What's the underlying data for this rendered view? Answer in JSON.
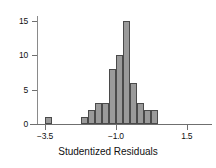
{
  "chart_data": {
    "type": "bar",
    "title": "",
    "subtitle": "",
    "xlabel": "Studentized Residuals",
    "ylabel": "",
    "xlim": [
      -3.75,
      2.25
    ],
    "ylim": [
      0,
      16
    ],
    "grid": false,
    "legend": null,
    "bin_width": 0.25,
    "x_ticks": [
      {
        "value": -3.5,
        "label": "−3.5"
      },
      {
        "value": -1.0,
        "label": "−1.0"
      },
      {
        "value": 1.5,
        "label": "1.5"
      }
    ],
    "y_ticks": [
      {
        "value": 0,
        "label": "0"
      },
      {
        "value": 5,
        "label": "5"
      },
      {
        "value": 10,
        "label": "10"
      },
      {
        "value": 15,
        "label": "15"
      }
    ],
    "bins": [
      {
        "start": -3.5,
        "end": -3.25,
        "count": 1
      },
      {
        "start": -3.25,
        "end": -3.0,
        "count": 0
      },
      {
        "start": -3.0,
        "end": -2.75,
        "count": 0
      },
      {
        "start": -2.75,
        "end": -2.5,
        "count": 0
      },
      {
        "start": -2.5,
        "end": -2.25,
        "count": 0
      },
      {
        "start": -2.25,
        "end": -2.0,
        "count": 1
      },
      {
        "start": -2.0,
        "end": -1.75,
        "count": 2
      },
      {
        "start": -1.75,
        "end": -1.5,
        "count": 3
      },
      {
        "start": -1.5,
        "end": -1.25,
        "count": 3
      },
      {
        "start": -1.25,
        "end": -1.0,
        "count": 8
      },
      {
        "start": -1.0,
        "end": -0.75,
        "count": 10
      },
      {
        "start": -0.75,
        "end": -0.5,
        "count": 15
      },
      {
        "start": -0.5,
        "end": -0.25,
        "count": 6
      },
      {
        "start": -0.25,
        "end": 0.0,
        "count": 3
      },
      {
        "start": 0.0,
        "end": 0.25,
        "count": 2
      },
      {
        "start": 0.25,
        "end": 0.5,
        "count": 2
      }
    ],
    "colors": {
      "bar_fill": "#9a9a9a",
      "bar_stroke": "#4a4a4a",
      "axis": "#6f6f6f",
      "text": "#111111",
      "background": "#ffffff"
    }
  }
}
